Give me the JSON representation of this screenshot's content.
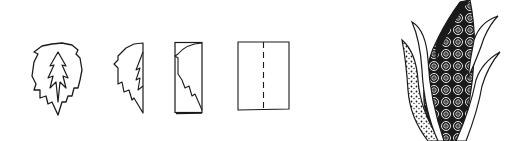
{
  "figure": {
    "colors": {
      "background": "#ffffff",
      "ink": "#1a1a1a"
    },
    "steps": [
      {
        "id": "step-1",
        "name": "full-leaf"
      },
      {
        "id": "step-2",
        "name": "half-leaf"
      },
      {
        "id": "step-3",
        "name": "folded-paper-with-half-leaf"
      },
      {
        "id": "step-4",
        "name": "paper-with-fold-line"
      },
      {
        "id": "step-5",
        "name": "decorated-corn"
      }
    ]
  }
}
